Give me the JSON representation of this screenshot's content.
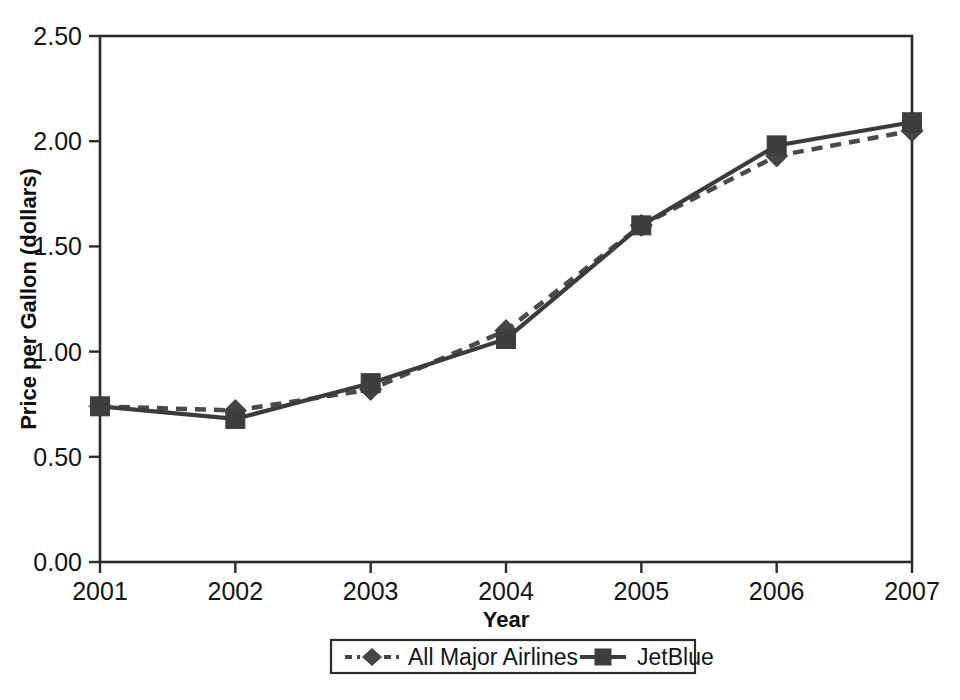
{
  "chart_data": {
    "type": "line",
    "title": "",
    "xlabel": "Year",
    "ylabel": "Price per Gallon (dollars)",
    "categories": [
      "2001",
      "2002",
      "2003",
      "2004",
      "2005",
      "2006",
      "2007"
    ],
    "x": [
      2001,
      2002,
      2003,
      2004,
      2005,
      2006,
      2007
    ],
    "xlim": [
      2001,
      2007
    ],
    "ylim": [
      0.0,
      2.5
    ],
    "ytick_labels": [
      "0.00",
      "0.50",
      "1.00",
      "1.50",
      "2.00",
      "2.50"
    ],
    "ytick_values": [
      0.0,
      0.5,
      1.0,
      1.5,
      2.0,
      2.5
    ],
    "xtick_labels": [
      "2001",
      "2002",
      "2003",
      "2004",
      "2005",
      "2006",
      "2007"
    ],
    "grid": false,
    "legend_position": "below-axis",
    "series": [
      {
        "name": "All Major Airlines",
        "marker": "diamond",
        "linestyle": "dashed",
        "color": "#454545",
        "values": [
          0.74,
          0.72,
          0.82,
          1.1,
          1.6,
          1.93,
          2.05
        ]
      },
      {
        "name": "JetBlue",
        "marker": "square",
        "linestyle": "solid",
        "color": "#3d3d3d",
        "values": [
          0.74,
          0.68,
          0.85,
          1.06,
          1.6,
          1.98,
          2.09
        ]
      }
    ]
  },
  "legend": {
    "entries": [
      {
        "label": "All Major Airlines",
        "marker": "diamond-marker-icon",
        "linestyle": "dashed"
      },
      {
        "label": "JetBlue",
        "marker": "square-marker-icon",
        "linestyle": "solid"
      }
    ]
  },
  "axes": {
    "x_title": "Year",
    "y_title": "Price per Gallon (dollars)"
  }
}
